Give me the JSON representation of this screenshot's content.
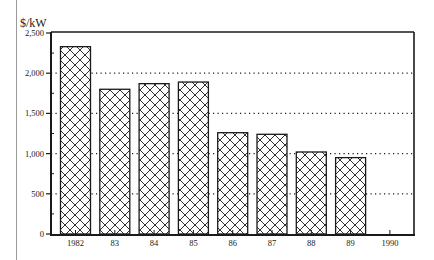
{
  "chart_data": {
    "type": "bar",
    "title": "",
    "xlabel": "",
    "ylabel": "$/kW",
    "categories": [
      "1982",
      "83",
      "84",
      "85",
      "86",
      "87",
      "88",
      "89",
      "1990"
    ],
    "values": [
      2330,
      1800,
      1870,
      1890,
      1260,
      1240,
      1020,
      950,
      null
    ],
    "ylim": [
      0,
      2500
    ],
    "yticks": [
      0,
      500,
      1000,
      1500,
      2000,
      2500
    ],
    "ytick_labels": [
      "0",
      "500",
      "1,000",
      "1,500",
      "2,000",
      "2,500"
    ],
    "grid": "dotted horizontal at 500, 1,000, 1,500, 2,000",
    "legend": null,
    "bar_fill": "cross-hatch",
    "colors": {
      "ink": "#1a1a1a",
      "background": "#ffffff",
      "rule": "#9a9a9a"
    }
  }
}
